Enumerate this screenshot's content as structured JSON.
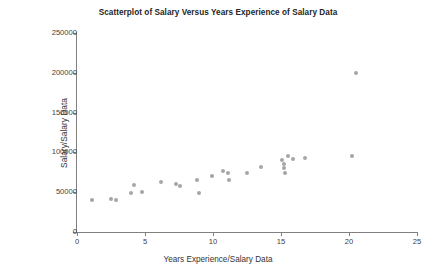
{
  "chart_data": {
    "type": "scatter",
    "title": "Scatterplot of Salary Versus Years Experience of Salary Data",
    "xlabel": "Years Experience/Salary Data",
    "ylabel": "Salary/Salary Data",
    "xlim": [
      0,
      25
    ],
    "ylim": [
      0,
      250000
    ],
    "xticks": [
      0,
      5,
      10,
      15,
      20,
      25
    ],
    "yticks": [
      0,
      50000,
      100000,
      150000,
      200000,
      250000
    ],
    "xticklabels": [
      "0",
      "5",
      "10",
      "15",
      "20",
      "25"
    ],
    "yticklabels": [
      "0",
      "50000",
      "100000",
      "150000",
      "200000",
      "250000"
    ],
    "grid": false,
    "legend": false,
    "marker_color": "#a6a6a6",
    "axis_color": "#808080",
    "series": [
      {
        "name": "Salary Data",
        "points": [
          [
            1.1,
            40000
          ],
          [
            2.5,
            41500
          ],
          [
            2.9,
            40000
          ],
          [
            4.0,
            49000
          ],
          [
            4.2,
            59000
          ],
          [
            4.8,
            50000
          ],
          [
            6.2,
            63000
          ],
          [
            7.3,
            60000
          ],
          [
            7.6,
            58000
          ],
          [
            8.8,
            65000
          ],
          [
            9.0,
            49500
          ],
          [
            9.9,
            70500
          ],
          [
            10.7,
            77000
          ],
          [
            11.1,
            73500
          ],
          [
            11.2,
            65500
          ],
          [
            12.5,
            74000
          ],
          [
            13.5,
            82000
          ],
          [
            15.1,
            90000
          ],
          [
            15.5,
            95000
          ],
          [
            15.9,
            92000
          ],
          [
            15.2,
            85000
          ],
          [
            15.2,
            80000
          ],
          [
            15.3,
            74500
          ],
          [
            16.8,
            92500
          ],
          [
            20.2,
            95000
          ],
          [
            20.5,
            200000
          ]
        ]
      }
    ]
  }
}
